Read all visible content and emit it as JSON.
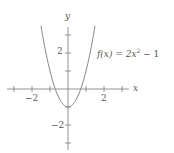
{
  "chart_data": {
    "type": "line",
    "title": "",
    "function_label": "f(x) = 2x^2 - 1",
    "function_label_parts": {
      "lhs": "f(x) = 2x",
      "exp": "2",
      "rhs": " − 1"
    },
    "xlabel": "x",
    "ylabel": "y",
    "xlim": [
      -3.3,
      3.3
    ],
    "ylim": [
      -3.1,
      3.5
    ],
    "xticks": [
      -3,
      -2,
      -1,
      1,
      2,
      3
    ],
    "xtick_labels": {
      "-2": "−2",
      "2": "2"
    },
    "yticks": [
      -3,
      -2,
      -1,
      1,
      2,
      3
    ],
    "ytick_labels": {
      "2": "2",
      "-2": "−2"
    },
    "grid": false,
    "series": [
      {
        "name": "f(x) = 2x^2 - 1",
        "expression": "2*x^2 - 1",
        "domain": [
          -1.5,
          1.5
        ],
        "color": "#888888"
      }
    ]
  },
  "labels": {
    "x_axis": "x",
    "y_axis": "y",
    "x_neg2": "−2",
    "x_pos2": "2",
    "y_pos2": "2",
    "y_neg2": "−2",
    "fn_lhs": "f(x) = 2x",
    "fn_exp": "2",
    "fn_rhs": " − 1"
  },
  "colors": {
    "axis": "#777777",
    "curve": "#888888",
    "text": "#555555"
  }
}
